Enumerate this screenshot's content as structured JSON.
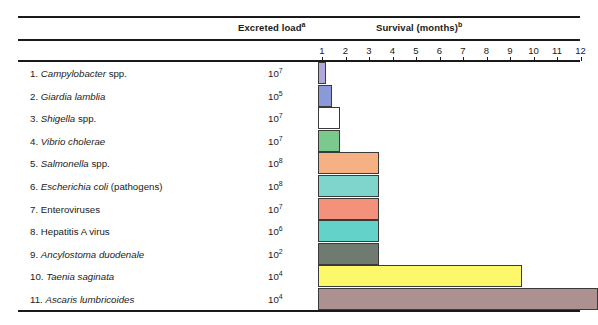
{
  "header": {
    "excreted_label": "Excreted load",
    "excreted_sup": "a",
    "survival_label": "Survival (months)",
    "survival_sup": "b"
  },
  "axis": {
    "ticks": [
      1,
      2,
      3,
      4,
      5,
      6,
      7,
      8,
      9,
      10,
      11,
      12
    ],
    "unit": "months",
    "x_origin_px": 318,
    "px_per_month": 23.5
  },
  "chart_data": {
    "type": "bar",
    "orientation": "horizontal",
    "title": "Survival (months)",
    "xlabel": "Survival (months)",
    "ylabel": "",
    "xlim": [
      0,
      12
    ],
    "grid": false,
    "legend": "none",
    "categories": [
      "1. Campylobacter spp.",
      "2. Giardia lamblia",
      "3. Shigella spp.",
      "4. Vibrio cholerae",
      "5. Salmonella spp.",
      "6. Escherichia coli (pathogens)",
      "7. Enteroviruses",
      "8. Hepatitis A virus",
      "9. Ancylostoma duodenale",
      "10. Taenia saginata",
      "11. Ascaris lumbricoides"
    ],
    "values": [
      0.35,
      0.6,
      0.95,
      0.95,
      2.6,
      2.6,
      2.6,
      2.6,
      2.6,
      8.7,
      11.9
    ],
    "value_unit": "months",
    "excreted_load": [
      "10^7",
      "10^5",
      "10^7",
      "10^7",
      "10^8",
      "10^8",
      "10^7",
      "10^6",
      "10^2",
      "10^4",
      "10^4"
    ],
    "colors": [
      "#b0a8d8",
      "#8a9ad8",
      "#ffffff",
      "#7cc98e",
      "#f5b183",
      "#7fd4cc",
      "#f4917b",
      "#63d2c8",
      "#6f7a70",
      "#fcf86a",
      "#ad9090"
    ]
  },
  "rows": [
    {
      "index": "1.",
      "name_italic": "Campylobacter",
      "name_plain": " spp.",
      "load_base": "10",
      "load_exp": "7",
      "bar_months": 0.35,
      "color": "#b0a8d8"
    },
    {
      "index": "2.",
      "name_italic": "Giardia lamblia",
      "name_plain": "",
      "load_base": "10",
      "load_exp": "5",
      "bar_months": 0.6,
      "color": "#8a9ad8"
    },
    {
      "index": "3.",
      "name_italic": "Shigella",
      "name_plain": " spp.",
      "load_base": "10",
      "load_exp": "7",
      "bar_months": 0.95,
      "color": "#ffffff"
    },
    {
      "index": "4.",
      "name_italic": "Vibrio cholerae",
      "name_plain": "",
      "load_base": "10",
      "load_exp": "7",
      "bar_months": 0.95,
      "color": "#7cc98e"
    },
    {
      "index": "5.",
      "name_italic": "Salmonella",
      "name_plain": " spp.",
      "load_base": "10",
      "load_exp": "8",
      "bar_months": 2.6,
      "color": "#f5b183"
    },
    {
      "index": "6.",
      "name_italic": "Escherichia coli",
      "name_plain": " (pathogens)",
      "load_base": "10",
      "load_exp": "8",
      "bar_months": 2.6,
      "color": "#7fd4cc"
    },
    {
      "index": "7.",
      "name_italic": "",
      "name_plain": "Enteroviruses",
      "load_base": "10",
      "load_exp": "7",
      "bar_months": 2.6,
      "color": "#f4917b"
    },
    {
      "index": "8.",
      "name_italic": "",
      "name_plain": "Hepatitis A virus",
      "load_base": "10",
      "load_exp": "6",
      "bar_months": 2.6,
      "color": "#63d2c8"
    },
    {
      "index": "9.",
      "name_italic": "Ancylostoma duodenale",
      "name_plain": "",
      "load_base": "10",
      "load_exp": "2",
      "bar_months": 2.6,
      "color": "#6f7a70"
    },
    {
      "index": "10.",
      "name_italic": "Taenia saginata",
      "name_plain": "",
      "load_base": "10",
      "load_exp": "4",
      "bar_months": 8.7,
      "color": "#fcf86a"
    },
    {
      "index": "11.",
      "name_italic": "Ascaris lumbricoides",
      "name_plain": "",
      "load_base": "10",
      "load_exp": "4",
      "bar_months": 11.9,
      "color": "#ad9090"
    }
  ]
}
